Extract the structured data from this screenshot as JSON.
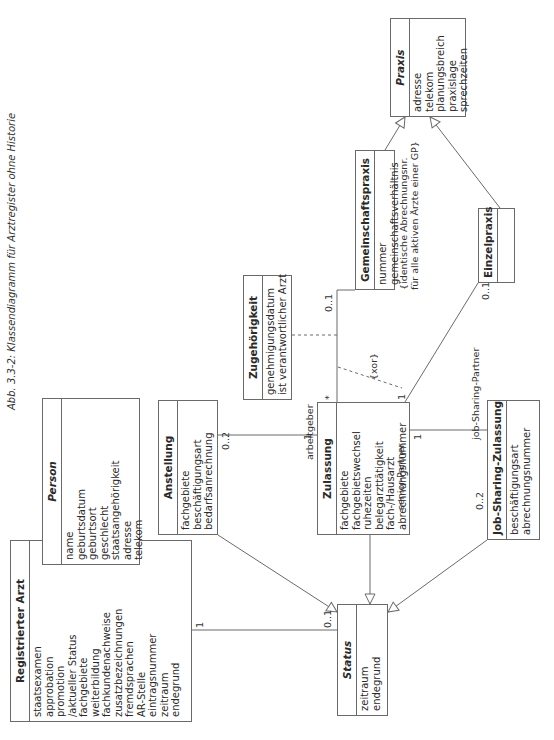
{
  "caption": "Abb. 3.3-2: Klassendiagramm für Arztregister ohne Historie",
  "classes": {
    "registrierter_arzt": {
      "name": "Registrierter Arzt",
      "attributes": [
        "staatsexamen",
        "approbation",
        "promotion",
        "/aktueller Status",
        "fachgebiete",
        "weiterbildung",
        "fachkundenachweise",
        "zusatzbezeichnungen",
        "fremdsprachen",
        "AR-Stelle",
        "eintragsnummer",
        "zeitraum",
        "endegrund"
      ]
    },
    "person": {
      "name": "Person",
      "abstract": true,
      "attributes": [
        "name",
        "geburtsdatum",
        "geburtsort",
        "geschlecht",
        "staatsangehörigkeit",
        "adresse",
        "telekom"
      ]
    },
    "anstellung": {
      "name": "Anstellung",
      "attributes": [
        "fachgebiete",
        "beschäftigungsart",
        "bedarfsanrechnung"
      ]
    },
    "status": {
      "name": "Status",
      "abstract": true,
      "attributes": [
        "zeitraum",
        "endegrund"
      ]
    },
    "zulassung": {
      "name": "Zulassung",
      "attributes": [
        "fachgebiete",
        "fachgebietswechsel",
        "ruhezeiten",
        "belegarzttätigkeit",
        "fach-/Hausarzt",
        "abrechnungsnummer"
      ]
    },
    "zugehoerigkeit": {
      "name": "Zugehörigkeit",
      "attributes": [
        "genehmigungsdatum",
        "ist verantwortlicher Arzt"
      ]
    },
    "gemeinschaftspraxis": {
      "name": "Gemeinschaftspraxis",
      "attributes": [
        "nummer",
        "gemeinschaftsverhältnis"
      ]
    },
    "praxis": {
      "name": "Praxis",
      "abstract": true,
      "attributes": [
        "adresse",
        "telekom",
        "planungsbreich",
        "praxislage",
        "sprechzeiten"
      ]
    },
    "einzelpraxis": {
      "name": "Einzelpraxis",
      "attributes": []
    },
    "job_sharing_zulassung": {
      "name": "Job-Sharing-Zulassung",
      "attributes": [
        "beschäftigungsart",
        "abrechnungsnummer"
      ]
    }
  },
  "labels": {
    "arzt_status_mult_arzt": "1",
    "arzt_status_mult_status": "0..1",
    "anstellung_mult": "0..2",
    "arbeitgeber_mult": "1",
    "arbeitgeber_role": "arbeitgeber",
    "zulassung_gp_mult_zul": "*",
    "zulassung_gp_mult_gp": "0..1",
    "xor": "{xor}",
    "zulassung_ep_mult_zul": "1",
    "zulassung_ep_mult_ep": "0..1",
    "senior_partner_role": "senior-Partner",
    "senior_partner_mult": "1",
    "job_sharing_role": "job-Sharing-Partner",
    "job_sharing_mult": "0..2",
    "gp_constraint_line1": "{identische Abrechnungsnr.",
    "gp_constraint_line2": "für alle aktiven Ärzte einer GP}"
  }
}
